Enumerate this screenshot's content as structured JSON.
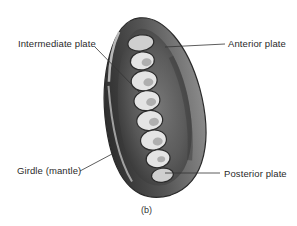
{
  "figure": {
    "caption": "(b)",
    "labels": [
      {
        "id": "intermediate",
        "text": "Intermediate plate"
      },
      {
        "id": "anterior",
        "text": "Anterior plate"
      },
      {
        "id": "girdle",
        "text": "Girdle (mantle)"
      },
      {
        "id": "posterior",
        "text": "Posterior plate"
      }
    ],
    "colors": {
      "background": "#ffffff",
      "specimen_dark": "#3a3a3a",
      "specimen_mid": "#6e6e6e",
      "specimen_light": "#d6d6d6",
      "text": "#2a2a2a",
      "leader_line": "#333333"
    }
  }
}
